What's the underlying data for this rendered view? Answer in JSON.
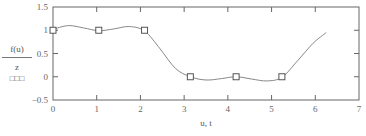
{
  "chart_data": {
    "type": "line",
    "title": "",
    "xlabel": "u, t",
    "ylabel_trace1": "f(u)",
    "ylabel_trace2": "z",
    "xlim": [
      0,
      7
    ],
    "ylim": [
      -0.5,
      1.5
    ],
    "x_ticks": [
      "0",
      "1",
      "2",
      "3",
      "4",
      "5",
      "6",
      "7"
    ],
    "y_ticks": [
      "1.5",
      "1",
      "0.5",
      "0",
      "-0.5"
    ],
    "grid": false,
    "series": [
      {
        "name": "f(u)",
        "style": "line",
        "x": [
          0,
          0.35,
          0.7,
          1.05,
          1.4,
          1.75,
          2.1,
          2.45,
          2.8,
          3.14,
          3.5,
          3.85,
          4.19,
          4.55,
          4.9,
          5.24,
          5.6,
          5.95,
          6.25
        ],
        "values": [
          1.02,
          1.1,
          1.05,
          0.99,
          1.03,
          1.08,
          0.98,
          0.6,
          0.18,
          0.0,
          -0.07,
          -0.04,
          0.0,
          -0.05,
          -0.09,
          -0.01,
          0.35,
          0.72,
          0.95
        ]
      },
      {
        "name": "z",
        "style": "markers",
        "marker": "open-square",
        "x": [
          0,
          1.047,
          2.094,
          3.142,
          4.189,
          5.236
        ],
        "values": [
          1,
          1,
          1,
          0,
          0,
          0
        ]
      }
    ],
    "legend_position": "left"
  },
  "legend": {
    "trace1": "f(u)",
    "trace2": "z",
    "trace2_marker": "□□□"
  },
  "axes": {
    "xlabel": "u, t",
    "x_ticks": [
      "0",
      "1",
      "2",
      "3",
      "4",
      "5",
      "6",
      "7"
    ],
    "y_ticks": [
      "1.5",
      "1",
      "0.5",
      "0",
      "−0.5"
    ]
  },
  "colors": {
    "frame": "#666666",
    "curve": "#888888",
    "marker": "#555555",
    "text": "#555555"
  }
}
